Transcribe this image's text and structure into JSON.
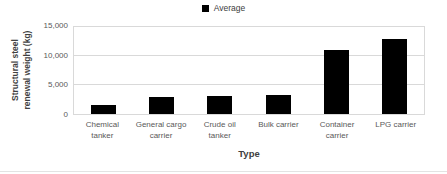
{
  "chart_data": {
    "type": "bar",
    "title": "",
    "legend": [
      "Average"
    ],
    "legend_position": "top-center",
    "categories": [
      "Chemical tanker",
      "General cargo carrier",
      "Crude oil tanker",
      "Bulk carrier",
      "Container carrier",
      "LPG carrier"
    ],
    "series": [
      {
        "name": "Average",
        "values": [
          1500,
          3000,
          3100,
          3300,
          11000,
          13000
        ]
      }
    ],
    "xlabel": "Type",
    "ylabel": "Structural steel renewal weight (kg)",
    "ylabel_lines": [
      "Structural steel",
      "renewal weight (kg)"
    ],
    "ylim": [
      0,
      15000
    ],
    "yticks": [
      {
        "value": 0,
        "label": "0"
      },
      {
        "value": 5000,
        "label": "5,000"
      },
      {
        "value": 10000,
        "label": "10,000"
      },
      {
        "value": 15000,
        "label": "15,000"
      }
    ],
    "grid": true,
    "bar_color": "#000000",
    "gridline_color": "#d9d9d9",
    "tick_text_color": "#595959",
    "axis_title_color": "#3f3f3f"
  }
}
